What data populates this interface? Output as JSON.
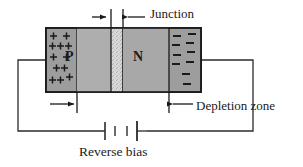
{
  "diagram": {
    "labels": {
      "junction": "Junction",
      "depletion_zone": "Depletion zone",
      "reverse_bias": "Reverse bias",
      "p_region": "P",
      "n_region": "N"
    },
    "charges": {
      "positive_symbol": "+",
      "negative_symbol": "−",
      "positive_rows": [
        2,
        3,
        2,
        2,
        3
      ],
      "negative_rows": [
        2,
        2,
        2,
        2,
        2
      ]
    },
    "colors": {
      "body_fill": "#a8a8a8",
      "charge_band_fill": "#9a9a9a",
      "junction_fill": "#d6d6d6",
      "outline": "#1a1a1a",
      "wire": "#2b2b2b",
      "text": "#1a1a1a",
      "background": "#ffffff"
    },
    "elements": {
      "left_wire": "left-terminal-wire",
      "right_wire": "right-terminal-wire",
      "battery": "battery-two-cell",
      "junction_arrow_left": "arrow-right",
      "junction_arrow_right": "arrow-left",
      "depletion_arrow_left": "arrow-right",
      "depletion_arrow_right": "arrow-left"
    }
  }
}
